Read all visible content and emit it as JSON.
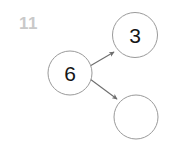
{
  "diagram": {
    "corner_label": "11",
    "corner_label_color": "#c9c9c9",
    "background_color": "#ffffff",
    "node_stroke_color": "#9a9a9a",
    "node_fill_color": "#ffffff",
    "edge_color": "#6e6e6e",
    "label_color": "#161616",
    "nodes": [
      {
        "id": "node-3",
        "label": "3",
        "cx": 135,
        "cy": 35,
        "r": 22.5,
        "has_label": true
      },
      {
        "id": "node-6",
        "label": "6",
        "cx": 70,
        "cy": 73,
        "r": 22,
        "has_label": true
      },
      {
        "id": "node-empty",
        "label": "",
        "cx": 136,
        "cy": 117,
        "r": 22,
        "has_label": false
      }
    ],
    "edges": [
      {
        "id": "edge-6-to-3",
        "from": "node-6",
        "to": "node-3",
        "x1": 90,
        "y1": 66,
        "x2": 114,
        "y2": 52,
        "arrowhead": "to"
      },
      {
        "id": "edge-6-to-empty",
        "from": "node-6",
        "to": "node-empty",
        "x1": 90,
        "y1": 79,
        "x2": 117,
        "y2": 99,
        "arrowhead": "to"
      }
    ]
  }
}
